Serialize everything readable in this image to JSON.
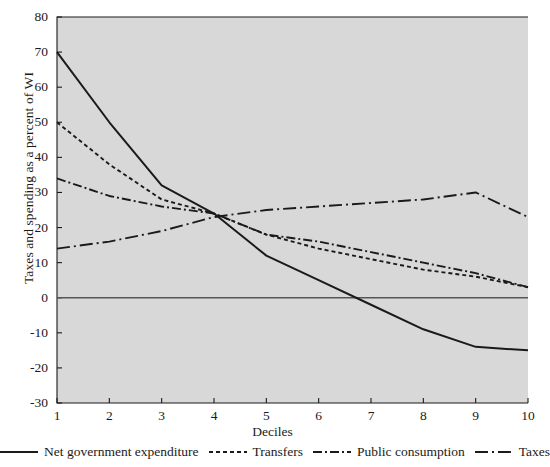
{
  "chart_data": {
    "type": "line",
    "title": "",
    "subtitle": "",
    "xlabel": "Deciles",
    "ylabel": "Taxes and spending as a percent of WI",
    "x": [
      1,
      2,
      3,
      4,
      5,
      6,
      7,
      8,
      9,
      10
    ],
    "xticklabels": [
      "1",
      "2",
      "3",
      "4",
      "5",
      "6",
      "7",
      "8",
      "9",
      "10"
    ],
    "yticklabels": [
      "80",
      "70",
      "60",
      "50",
      "40",
      "30",
      "20",
      "10",
      "0",
      "-10",
      "-20",
      "-30"
    ],
    "ytickvalues": [
      80,
      70,
      60,
      50,
      40,
      30,
      20,
      10,
      0,
      -10,
      -20,
      -30
    ],
    "xlim": [
      1,
      10
    ],
    "ylim": [
      -30,
      80
    ],
    "grid": false,
    "legend_position": "below",
    "zero_line": true,
    "plot_background": "#d8d8d8",
    "line_color": "#1a1a1a",
    "series": [
      {
        "name": "Net government expenditure",
        "style": "solid",
        "values": [
          70,
          50,
          32,
          24,
          12,
          5,
          -2,
          -9,
          -14,
          -15
        ]
      },
      {
        "name": "Transfers",
        "style": "dotted",
        "values": [
          50,
          38,
          28,
          24,
          18,
          14,
          11,
          8,
          6,
          3
        ]
      },
      {
        "name": "Public consumption",
        "style": "dash-dot",
        "values": [
          34,
          29,
          26,
          24,
          18,
          16,
          13,
          10,
          7,
          3
        ]
      },
      {
        "name": "Taxes",
        "style": "long-dash-dot",
        "values": [
          14,
          16,
          19,
          23,
          25,
          26,
          27,
          28,
          30,
          23
        ]
      }
    ]
  },
  "legend": {
    "items": [
      {
        "label": "Net government expenditure",
        "icon": "solid-line-icon"
      },
      {
        "label": "Transfers",
        "icon": "dotted-line-icon"
      },
      {
        "label": "Public consumption",
        "icon": "dash-dot-line-icon"
      },
      {
        "label": "Taxes",
        "icon": "long-dash-dot-line-icon"
      }
    ]
  }
}
